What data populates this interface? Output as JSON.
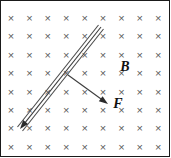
{
  "figure": {
    "width": 171,
    "height": 158,
    "background_color": "#ffffff",
    "border_color": "#1a1a1a"
  },
  "field": {
    "symbol": "×",
    "meaning": "magnetic-field-into-page",
    "color": "#5b5b5b",
    "columns": 9,
    "rows": 8,
    "x_start": 11,
    "y_start": 19,
    "x_spacing": 18.4,
    "y_spacing": 18.4
  },
  "labels": {
    "magnetic_field": {
      "text": "B",
      "x": 125,
      "y": 68,
      "color": "#111111"
    },
    "force": {
      "text": "F",
      "x": 118,
      "y": 105,
      "color": "#111111"
    }
  },
  "rod": {
    "name": "conducting-rod",
    "color": "#4a4a4a",
    "start_x": 20,
    "start_y": 129,
    "end_x": 101,
    "end_y": 27,
    "offset": 3.2,
    "has_arrowhead_at_start": true
  },
  "force_arrow": {
    "name": "force-vector",
    "color": "#3d3d3d",
    "start_x": 68,
    "start_y": 75,
    "end_x": 108,
    "end_y": 104
  },
  "colors": {
    "cross_gray": "#5b5b5b",
    "line_gray": "#4a4a4a",
    "arrow_black": "#2b2b2b",
    "label_black": "#111111",
    "border": "#1a1a1a",
    "background": "#ffffff"
  }
}
